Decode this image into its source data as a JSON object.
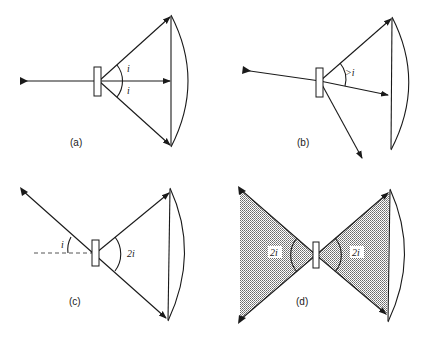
{
  "figure": {
    "panels": [
      {
        "id": "a",
        "label": "(a)",
        "angle_labels": [
          "i",
          "i"
        ]
      },
      {
        "id": "b",
        "label": "(b)",
        "angle_labels": [
          ">i"
        ]
      },
      {
        "id": "c",
        "label": "(c)",
        "angle_labels": [
          "i",
          "2i"
        ]
      },
      {
        "id": "d",
        "label": "(d)",
        "angle_labels": [
          "2i",
          "2i"
        ]
      }
    ],
    "colors": {
      "line": "#1a1a1a",
      "shade": "#9a9a9a",
      "background": "#ffffff"
    }
  }
}
